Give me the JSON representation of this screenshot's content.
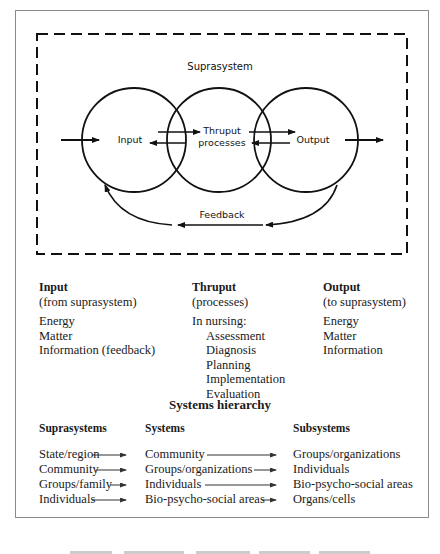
{
  "diagram": {
    "suprasystem_label": "Suprasystem",
    "input_label": "Input",
    "thruput_label_line1": "Thruput",
    "thruput_label_line2": "processes",
    "output_label": "Output",
    "feedback_label": "Feedback"
  },
  "columns": [
    {
      "heading": "Input",
      "subheading": "(from suprasystem)",
      "items": [
        "Energy",
        "Matter",
        "Information (feedback)"
      ]
    },
    {
      "heading": "Thruput",
      "subheading": "(processes)",
      "intro": "In nursing:",
      "items": [
        "Assessment",
        "Diagnosis",
        "Planning",
        "Implementation",
        "Evaluation"
      ]
    },
    {
      "heading": "Output",
      "subheading": "(to suprasystem)",
      "items": [
        "Energy",
        "Matter",
        "Information"
      ]
    }
  ],
  "hierarchy": {
    "title": "Systems hierarchy",
    "headers": [
      "Suprasystems",
      "Systems",
      "Subsystems"
    ],
    "rows": [
      [
        "State/region",
        "Community",
        "Groups/organizations"
      ],
      [
        "Community",
        "Groups/organizations",
        "Individuals"
      ],
      [
        "Groups/family",
        "Individuals",
        "Bio-psycho-social areas"
      ],
      [
        "Individuals",
        "Bio-psycho-social areas",
        "Organs/cells"
      ]
    ]
  }
}
